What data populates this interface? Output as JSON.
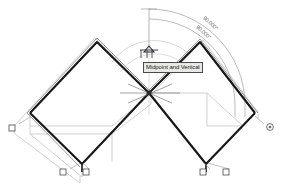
{
  "drawing": {
    "title": "AutoCAD isometric solids with angular dimensions",
    "background_color": "#ffffff",
    "solid_edge_color": "#1a1a1a",
    "construction_line_color": "#b8b8b8",
    "dimension_color": "#8a8a8a",
    "grip_color": "#555555",
    "tracking_line_color": "#c0c0c0"
  },
  "tooltip": {
    "text": "Midpoint and Vertical",
    "x": 143,
    "y": 62,
    "background": "#e9e9e4",
    "border": "#4a4a4a"
  },
  "cursor": {
    "label": "",
    "x": 146,
    "y": 54
  },
  "dimensions": [
    {
      "name": "angle-outer",
      "value": "90.000°",
      "x": 206,
      "y": 16,
      "rotation": 42
    },
    {
      "name": "angle-inner",
      "value": "90.000°",
      "x": 199,
      "y": 24,
      "rotation": 42
    }
  ],
  "grips": [
    {
      "name": "grip-left-west",
      "shape": "square",
      "x": 12,
      "y": 128
    },
    {
      "name": "grip-bottom-left-a",
      "shape": "square",
      "x": 63,
      "y": 172
    },
    {
      "name": "grip-bottom-left-b",
      "shape": "square",
      "x": 86,
      "y": 172
    },
    {
      "name": "grip-bottom-right-a",
      "shape": "square",
      "x": 203,
      "y": 172
    },
    {
      "name": "grip-bottom-right-b",
      "shape": "square",
      "x": 226,
      "y": 172
    },
    {
      "name": "grip-right-east",
      "shape": "circle",
      "x": 270,
      "y": 127
    }
  ],
  "geometry": {
    "left_solid": {
      "top_face": "30,113 97,42 149,93 82,164",
      "front_edge": "30,113 30,124 82,175 82,164",
      "right_edge": "82,164 82,175 149,104 149,93"
    },
    "right_solid": {
      "top_face": "149,93 200,42 255,113 206,164"
    },
    "center_vertex": {
      "x": 149,
      "y": 93
    },
    "apex_left": {
      "x": 97,
      "y": 42
    },
    "apex_right": {
      "x": 200,
      "y": 42
    },
    "snap_point": {
      "x": 149,
      "y": 49
    }
  }
}
